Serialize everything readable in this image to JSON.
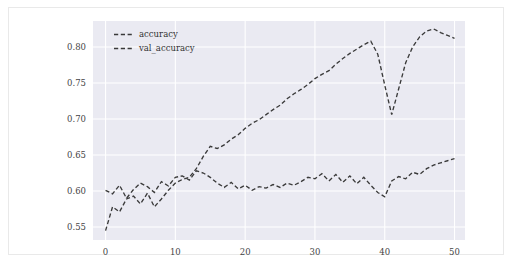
{
  "chart_data": {
    "type": "line",
    "title": "",
    "xlabel": "",
    "ylabel": "",
    "xlim": [
      -1.8,
      51.5
    ],
    "ylim": [
      0.532,
      0.836
    ],
    "xticks": [
      0,
      10,
      20,
      30,
      40,
      50
    ],
    "xticklabels": [
      "0",
      "10",
      "20",
      "30",
      "40",
      "50"
    ],
    "yticks": [
      0.55,
      0.6,
      0.65,
      0.7,
      0.75,
      0.8
    ],
    "yticklabels": [
      "0.55",
      "0.60",
      "0.65",
      "0.70",
      "0.75",
      "0.80"
    ],
    "grid": true,
    "grid_color": "#ffffff",
    "axes_facecolor": "#eaeaf2",
    "figure_facecolor": "#ffffff",
    "legend_position": "upper left",
    "legend_frame": false,
    "linestyle": "dashed",
    "line_color": "#3a3a3a",
    "x": [
      0,
      1,
      2,
      3,
      4,
      5,
      6,
      7,
      8,
      9,
      10,
      11,
      12,
      13,
      14,
      15,
      16,
      17,
      18,
      19,
      20,
      21,
      22,
      23,
      24,
      25,
      26,
      27,
      28,
      29,
      30,
      31,
      32,
      33,
      34,
      35,
      36,
      37,
      38,
      39,
      40,
      41,
      42,
      43,
      44,
      45,
      46,
      47,
      48,
      49,
      50
    ],
    "series": [
      {
        "name": "accuracy",
        "color": "#3a3a3a",
        "values": [
          0.545,
          0.578,
          0.571,
          0.589,
          0.593,
          0.582,
          0.597,
          0.578,
          0.589,
          0.601,
          0.611,
          0.616,
          0.619,
          0.631,
          0.648,
          0.662,
          0.659,
          0.664,
          0.672,
          0.678,
          0.687,
          0.694,
          0.699,
          0.706,
          0.713,
          0.719,
          0.728,
          0.735,
          0.741,
          0.748,
          0.756,
          0.762,
          0.767,
          0.776,
          0.784,
          0.791,
          0.797,
          0.803,
          0.808,
          0.79,
          0.747,
          0.706,
          0.742,
          0.778,
          0.8,
          0.814,
          0.822,
          0.825,
          0.82,
          0.816,
          0.812
        ]
      },
      {
        "name": "val_accuracy",
        "color": "#3a3a3a",
        "values": [
          0.601,
          0.596,
          0.608,
          0.59,
          0.602,
          0.611,
          0.606,
          0.598,
          0.613,
          0.607,
          0.619,
          0.621,
          0.615,
          0.628,
          0.625,
          0.619,
          0.611,
          0.605,
          0.612,
          0.603,
          0.608,
          0.601,
          0.606,
          0.604,
          0.609,
          0.605,
          0.611,
          0.608,
          0.613,
          0.619,
          0.617,
          0.624,
          0.614,
          0.623,
          0.612,
          0.621,
          0.61,
          0.619,
          0.608,
          0.598,
          0.592,
          0.614,
          0.62,
          0.617,
          0.626,
          0.623,
          0.631,
          0.636,
          0.639,
          0.642,
          0.645
        ]
      }
    ]
  },
  "legend": {
    "items": [
      {
        "label": "accuracy"
      },
      {
        "label": "val_accuracy"
      }
    ]
  }
}
